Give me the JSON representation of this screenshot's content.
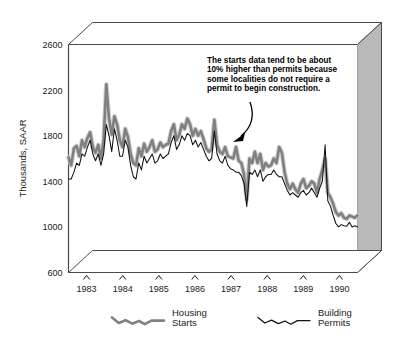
{
  "chart_data": {
    "type": "line",
    "title": "",
    "xlabel": "",
    "ylabel": "Thousands, SAAR",
    "ylim": [
      600,
      2600
    ],
    "yticks": [
      600,
      1000,
      1400,
      1800,
      2200,
      2600
    ],
    "ytick_labels": [
      "600",
      "1000",
      "1400",
      "1800",
      "2200",
      "2600"
    ],
    "xlim": [
      1983.0,
      1991.0
    ],
    "xticks": [
      1983,
      1984,
      1985,
      1986,
      1987,
      1988,
      1989,
      1990
    ],
    "xtick_labels": [
      "1983",
      "1984",
      "1985",
      "1986",
      "1987",
      "1988",
      "1989",
      "1990"
    ],
    "grid": false,
    "legend_position": "bottom",
    "annotation": {
      "lines": [
        "The starts data tend to be about",
        "10% higher than permits because",
        "some localities do not require a",
        "permit to begin construction."
      ],
      "arrow": "curved arrow pointing down-left to the series lines"
    },
    "series": [
      {
        "name": "Housing Starts",
        "color": "#808080",
        "style": "thick gray line",
        "values": [
          1610,
          1540,
          1690,
          1710,
          1620,
          1760,
          1700,
          1780,
          1830,
          1700,
          1650,
          1720,
          1600,
          1760,
          2250,
          1950,
          1810,
          1970,
          1900,
          1760,
          1700,
          1860,
          1790,
          1640,
          1560,
          1540,
          1690,
          1620,
          1730,
          1660,
          1700,
          1760,
          1660,
          1680,
          1740,
          1700,
          1720,
          1730,
          1840,
          1900,
          1760,
          1810,
          1900,
          1860,
          1950,
          1900,
          1800,
          1860,
          1800,
          1840,
          1770,
          1690,
          1660,
          1680,
          1940,
          1720,
          1660,
          1640,
          1700,
          1620,
          1610,
          1600,
          1700,
          1580,
          1560,
          1460,
          1240,
          1600,
          1560,
          1660,
          1560,
          1640,
          1500,
          1560,
          1530,
          1540,
          1600,
          1560,
          1700,
          1650,
          1480,
          1380,
          1330,
          1380,
          1330,
          1300,
          1380,
          1420,
          1340,
          1360,
          1400,
          1380,
          1300,
          1420,
          1500,
          1600,
          1300,
          1260,
          1200,
          1130,
          1100,
          1120,
          1080,
          1070,
          1100,
          1090,
          1080,
          1100
        ]
      },
      {
        "name": "Building Permits",
        "color": "#111111",
        "style": "thin black line",
        "values": [
          1420,
          1420,
          1480,
          1560,
          1540,
          1640,
          1620,
          1700,
          1760,
          1640,
          1580,
          1640,
          1540,
          1640,
          1900,
          1800,
          1660,
          1860,
          1760,
          1620,
          1620,
          1760,
          1700,
          1540,
          1440,
          1420,
          1560,
          1500,
          1620,
          1560,
          1600,
          1640,
          1560,
          1580,
          1640,
          1600,
          1620,
          1640,
          1740,
          1800,
          1680,
          1720,
          1800,
          1760,
          1820,
          1800,
          1720,
          1760,
          1700,
          1740,
          1680,
          1620,
          1580,
          1600,
          1840,
          1640,
          1580,
          1560,
          1620,
          1540,
          1510,
          1500,
          1480,
          1480,
          1450,
          1380,
          1180,
          1480,
          1460,
          1500,
          1440,
          1500,
          1400,
          1440,
          1460,
          1460,
          1500,
          1460,
          1440,
          1440,
          1380,
          1320,
          1280,
          1300,
          1280,
          1260,
          1300,
          1320,
          1280,
          1300,
          1340,
          1300,
          1260,
          1340,
          1400,
          1720,
          1230,
          1180,
          1100,
          1030,
          1000,
          1020,
          1010,
          1005,
          1040,
          1000,
          1010,
          1000
        ]
      }
    ]
  },
  "legend": {
    "items": [
      {
        "label_line1": "Housing",
        "label_line2": "Starts",
        "series": "Housing Starts"
      },
      {
        "label_line1": "Building",
        "label_line2": "Permits",
        "series": "Building Permits"
      }
    ]
  },
  "colors": {
    "starts_line": "#808080",
    "permits_line": "#111111",
    "box_right_face": "#b9b9b9",
    "box_top_face": "#ffffff",
    "box_outline": "#4a4a4a",
    "plot_background": "#ffffff"
  }
}
